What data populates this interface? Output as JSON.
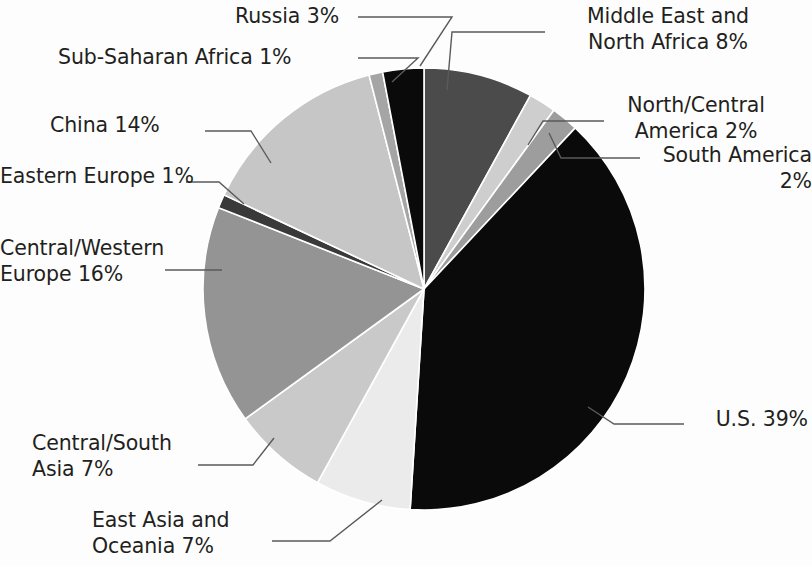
{
  "chart_data": {
    "type": "pie",
    "title": "",
    "subtitle": "",
    "xlabel": "",
    "ylabel": "",
    "legend_position": "none",
    "labels_mode": "leader-lines-outside",
    "units": "percent",
    "total": 100,
    "start_angle_deg": 0,
    "direction": "clockwise",
    "categories": [
      "Middle East and North Africa",
      "North/Central America",
      "South America",
      "U.S.",
      "East Asia and Oceania",
      "Central/South Asia",
      "Central/Western Europe",
      "Eastern Europe",
      "China",
      "Sub-Saharan Africa",
      "Russia"
    ],
    "values": [
      8,
      2,
      2,
      39,
      7,
      7,
      16,
      1,
      14,
      1,
      3
    ],
    "slices": [
      {
        "name": "Middle East and North Africa",
        "label": "Middle East and\nNorth Africa 8%",
        "value": 8,
        "value_text": "8%",
        "color": "#4b4b4b"
      },
      {
        "name": "North/Central America",
        "label": "North/Central\nAmerica 2%",
        "value": 2,
        "value_text": "2%",
        "color": "#cecece"
      },
      {
        "name": "South America",
        "label": "South America 2%",
        "value": 2,
        "value_text": "2%",
        "color": "#9d9d9d"
      },
      {
        "name": "U.S.",
        "label": "U.S. 39%",
        "value": 39,
        "value_text": "39%",
        "color": "#0a0a0a"
      },
      {
        "name": "East Asia and Oceania",
        "label": "East Asia and\nOceania 7%",
        "value": 7,
        "value_text": "7%",
        "color": "#ebebeb"
      },
      {
        "name": "Central/South Asia",
        "label": "Central/South\nAsia 7%",
        "value": 7,
        "value_text": "7%",
        "color": "#c9c9c9"
      },
      {
        "name": "Central/Western Europe",
        "label": "Central/Western\nEurope 16%",
        "value": 16,
        "value_text": "16%",
        "color": "#949494"
      },
      {
        "name": "Eastern Europe",
        "label": "Eastern Europe 1%",
        "value": 1,
        "value_text": "1%",
        "color": "#3a3a3a"
      },
      {
        "name": "China",
        "label": "China 14%",
        "value": 14,
        "value_text": "14%",
        "color": "#c6c6c6"
      },
      {
        "name": "Sub-Saharan Africa",
        "label": "Sub-Saharan Africa 1%",
        "value": 1,
        "value_text": "1%",
        "color": "#a5a5a5"
      },
      {
        "name": "Russia",
        "label": "Russia 3%",
        "value": 3,
        "value_text": "3%",
        "color": "#0a0a0a"
      }
    ],
    "colors": {
      "background": "#fdfdfd",
      "text": "#231f20",
      "leader_line": "#5a5a5a",
      "slice_border": "#ffffff"
    }
  },
  "labels": {
    "russia": "Russia 3%",
    "sub_saharan_africa": "Sub-Saharan Africa 1%",
    "china": "China 14%",
    "eastern_europe": "Eastern Europe 1%",
    "central_western_europe": "Central/Western\nEurope 16%",
    "central_south_asia": "Central/South\nAsia 7%",
    "east_asia_oceania": "East Asia and\nOceania 7%",
    "middle_east_north_africa": "Middle East and\nNorth Africa 8%",
    "north_central_america": "North/Central\nAmerica 2%",
    "south_america": "South America 2%",
    "us": "U.S. 39%"
  }
}
